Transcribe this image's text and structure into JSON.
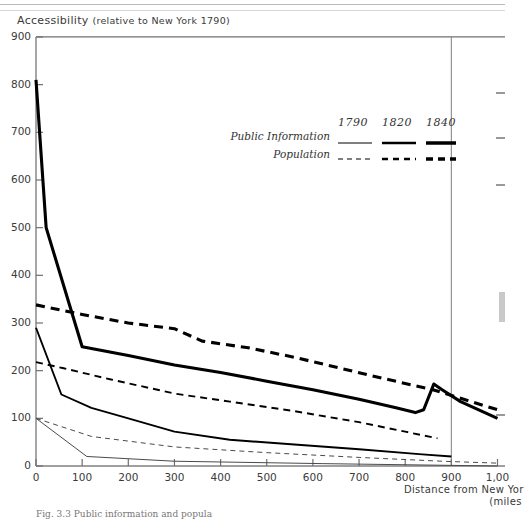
{
  "figure": {
    "y_axis_title": "Accessibility",
    "y_axis_subtitle": "(relative to New York 1790)",
    "x_axis_title_line1": "Distance from New Yor",
    "x_axis_title_line2": "(miles",
    "caption": "Fig. 3.3  Public information and popula"
  },
  "legend": {
    "years": [
      "1790",
      "1820",
      "1840"
    ],
    "rows": [
      {
        "label": "Public Information",
        "style": "solid"
      },
      {
        "label": "Population",
        "style": "dashed"
      }
    ]
  },
  "chart_data": {
    "type": "line",
    "title": "Accessibility (relative to New York 1790)",
    "xlabel": "Distance from New York (miles)",
    "ylabel": "Accessibility (relative to New York 1790)",
    "xlim": [
      0,
      1000
    ],
    "ylim": [
      0,
      900
    ],
    "x_ticks": [
      0,
      100,
      200,
      300,
      400,
      500,
      600,
      700,
      800,
      900,
      1000
    ],
    "x_tick_labels": [
      "0",
      "100",
      "200",
      "300",
      "400",
      "500",
      "600",
      "700",
      "800",
      "900",
      "1,00"
    ],
    "y_ticks": [
      0,
      100,
      200,
      300,
      400,
      500,
      600,
      700,
      800,
      900
    ],
    "y_tick_labels": [
      "0",
      "100",
      "200",
      "300",
      "400",
      "500",
      "600",
      "700",
      "800",
      "900"
    ],
    "grid": false,
    "legend_position": "upper-center-right",
    "series": [
      {
        "name": "Public Information 1790",
        "year": "1790",
        "variable": "Public Information",
        "style": "solid",
        "width": 1,
        "points": [
          [
            0,
            100
          ],
          [
            110,
            20
          ],
          [
            300,
            10
          ],
          [
            620,
            5
          ],
          [
            1000,
            0
          ]
        ]
      },
      {
        "name": "Population 1790",
        "year": "1790",
        "variable": "Population",
        "style": "dashed",
        "width": 1,
        "points": [
          [
            0,
            100
          ],
          [
            120,
            62
          ],
          [
            300,
            40
          ],
          [
            500,
            28
          ],
          [
            700,
            18
          ],
          [
            880,
            10
          ],
          [
            1000,
            6
          ]
        ]
      },
      {
        "name": "Public Information 1820",
        "year": "1820",
        "variable": "Public Information",
        "style": "solid",
        "width": 2,
        "points": [
          [
            0,
            290
          ],
          [
            55,
            150
          ],
          [
            120,
            122
          ],
          [
            200,
            100
          ],
          [
            300,
            72
          ],
          [
            420,
            55
          ],
          [
            560,
            45
          ],
          [
            700,
            35
          ],
          [
            830,
            25
          ],
          [
            900,
            20
          ]
        ]
      },
      {
        "name": "Population 1820",
        "year": "1820",
        "variable": "Population",
        "style": "dashed",
        "width": 2,
        "points": [
          [
            0,
            218
          ],
          [
            60,
            205
          ],
          [
            160,
            182
          ],
          [
            300,
            152
          ],
          [
            420,
            135
          ],
          [
            560,
            115
          ],
          [
            700,
            92
          ],
          [
            800,
            72
          ],
          [
            870,
            58
          ]
        ]
      },
      {
        "name": "Public Information 1840",
        "year": "1840",
        "variable": "Public Information",
        "style": "solid",
        "width": 3,
        "points": [
          [
            0,
            810
          ],
          [
            22,
            500
          ],
          [
            100,
            250
          ],
          [
            200,
            232
          ],
          [
            300,
            212
          ],
          [
            400,
            196
          ],
          [
            500,
            178
          ],
          [
            600,
            160
          ],
          [
            700,
            140
          ],
          [
            780,
            122
          ],
          [
            822,
            112
          ],
          [
            840,
            118
          ],
          [
            862,
            172
          ],
          [
            880,
            160
          ],
          [
            920,
            135
          ],
          [
            1000,
            100
          ]
        ]
      },
      {
        "name": "Population 1840",
        "year": "1840",
        "variable": "Population",
        "style": "dashed",
        "width": 3,
        "points": [
          [
            0,
            338
          ],
          [
            100,
            318
          ],
          [
            200,
            300
          ],
          [
            300,
            288
          ],
          [
            360,
            262
          ],
          [
            460,
            248
          ],
          [
            560,
            228
          ],
          [
            660,
            205
          ],
          [
            760,
            182
          ],
          [
            860,
            160
          ],
          [
            1000,
            118
          ]
        ]
      }
    ]
  }
}
